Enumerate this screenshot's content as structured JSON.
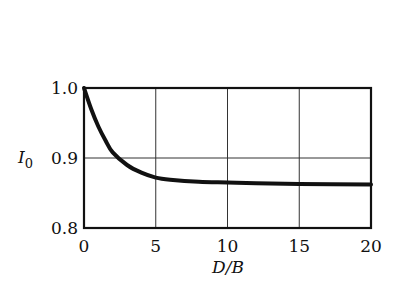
{
  "chart_data": {
    "type": "line",
    "title": "",
    "xlabel": "D/B",
    "ylabel": "I0",
    "xlim": [
      0,
      20
    ],
    "ylim": [
      0.8,
      1.0
    ],
    "x_ticks": [
      "0",
      "5",
      "10",
      "15",
      "20"
    ],
    "y_ticks": [
      "0.8",
      "0.9",
      "1.0"
    ],
    "grid": true,
    "legend": null,
    "series": [
      {
        "name": "I0",
        "x": [
          0,
          0.5,
          1,
          1.5,
          2,
          3,
          4,
          5,
          6,
          8,
          10,
          12,
          15,
          20
        ],
        "y": [
          1.0,
          0.97,
          0.945,
          0.925,
          0.908,
          0.89,
          0.879,
          0.872,
          0.869,
          0.866,
          0.865,
          0.864,
          0.863,
          0.862
        ]
      }
    ]
  },
  "labels": {
    "ylabel_main": "I",
    "ylabel_sub": "0",
    "xlabel": "D/B"
  }
}
